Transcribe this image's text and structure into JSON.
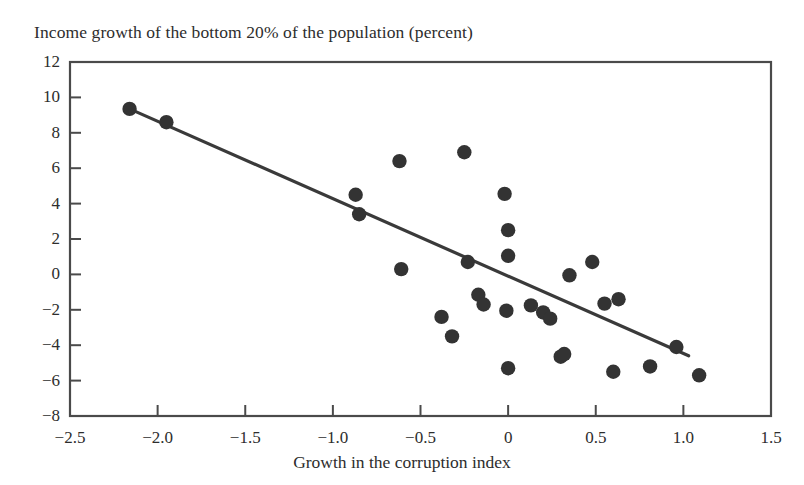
{
  "chart_data": {
    "type": "scatter",
    "title": "Income growth of the bottom 20% of the population (percent)",
    "xlabel": "Growth in the corruption index",
    "ylabel": "",
    "xlim": [
      -2.5,
      1.5
    ],
    "ylim": [
      -8,
      12
    ],
    "xticks": [
      -2.5,
      -2.0,
      -1.5,
      -1.0,
      -0.5,
      0,
      0.5,
      1.0,
      1.5
    ],
    "xtick_labels": [
      "−2.5",
      "−2.0",
      "−1.5",
      "−1.0",
      "−0.5",
      "0",
      "0.5",
      "1.0",
      "1.5"
    ],
    "yticks": [
      12,
      10,
      8,
      6,
      4,
      2,
      0,
      -2,
      -4,
      -6,
      -8
    ],
    "ytick_labels": [
      "12",
      "10",
      "8",
      "6",
      "4",
      "2",
      "0",
      "−2",
      "−4",
      "−6",
      "−8"
    ],
    "grid": false,
    "legend": null,
    "marker_color": "#333333",
    "line_color": "#3a3a3a",
    "axis_color": "#4a4a4a",
    "points": [
      {
        "x": -2.16,
        "y": 9.35
      },
      {
        "x": -1.95,
        "y": 8.6
      },
      {
        "x": -0.87,
        "y": 4.5
      },
      {
        "x": -0.85,
        "y": 3.4
      },
      {
        "x": -0.62,
        "y": 6.4
      },
      {
        "x": -0.61,
        "y": 0.3
      },
      {
        "x": -0.38,
        "y": -2.4
      },
      {
        "x": -0.32,
        "y": -3.5
      },
      {
        "x": -0.25,
        "y": 6.9
      },
      {
        "x": -0.23,
        "y": 0.7
      },
      {
        "x": -0.17,
        "y": -1.15
      },
      {
        "x": -0.14,
        "y": -1.7
      },
      {
        "x": -0.02,
        "y": 4.55
      },
      {
        "x": 0.0,
        "y": 2.5
      },
      {
        "x": 0.0,
        "y": 1.05
      },
      {
        "x": -0.01,
        "y": -2.05
      },
      {
        "x": 0.0,
        "y": -5.3
      },
      {
        "x": 0.13,
        "y": -1.75
      },
      {
        "x": 0.2,
        "y": -2.15
      },
      {
        "x": 0.24,
        "y": -2.5
      },
      {
        "x": 0.3,
        "y": -4.65
      },
      {
        "x": 0.32,
        "y": -4.5
      },
      {
        "x": 0.35,
        "y": -0.05
      },
      {
        "x": 0.48,
        "y": 0.7
      },
      {
        "x": 0.55,
        "y": -1.65
      },
      {
        "x": 0.63,
        "y": -1.4
      },
      {
        "x": 0.6,
        "y": -5.5
      },
      {
        "x": 0.81,
        "y": -5.2
      },
      {
        "x": 0.96,
        "y": -4.1
      },
      {
        "x": 1.09,
        "y": -5.7
      }
    ],
    "trendline": {
      "x_start": -2.16,
      "y_start": 9.35,
      "x_end": 1.03,
      "y_end": -4.6
    }
  }
}
